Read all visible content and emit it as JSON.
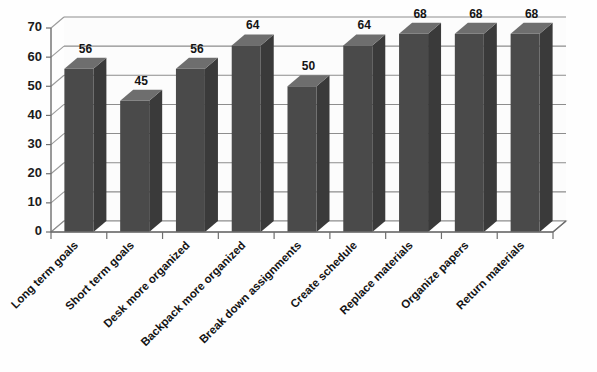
{
  "chart_data": {
    "type": "bar",
    "title": "",
    "subtitle": "",
    "xlabel": "",
    "ylabel": "",
    "ylim": [
      0,
      70
    ],
    "ytick_step": 10,
    "yticks": [
      "0",
      "10",
      "20",
      "30",
      "40",
      "50",
      "60",
      "70"
    ],
    "grid": true,
    "legend": "none",
    "style_3d": true,
    "categories": [
      "Long term goals",
      "Short term goals",
      "Desk more organized",
      "Backpack more organized",
      "Break down assignments",
      "Create schedule",
      "Replace materials",
      "Organize papers",
      "Return materials"
    ],
    "values": [
      56,
      45,
      56,
      64,
      50,
      64,
      68,
      68,
      68
    ],
    "data_labels": [
      "56",
      "45",
      "56",
      "64",
      "50",
      "64",
      "68",
      "68",
      "68"
    ],
    "colors": {
      "bar_front": "#4a4a4a",
      "bar_top": "#6e6e6e",
      "bar_side": "#3a3a3a",
      "grid": "#8d8d8d",
      "axis": "#6e6e6e",
      "text": "#141414",
      "background": "#fefefe"
    }
  }
}
